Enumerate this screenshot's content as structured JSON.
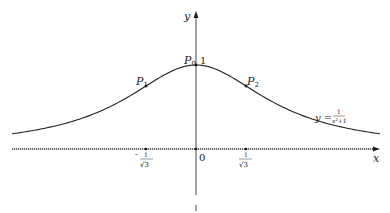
{
  "figure": {
    "axes": {
      "x_label": "x",
      "y_label": "y",
      "origin_label": "0"
    },
    "curve": {
      "equation_lhs": "y =",
      "equation_num": "1",
      "equation_den": "x²+1"
    },
    "points": [
      {
        "name": "P0",
        "label": "P",
        "sub": "0",
        "value_label": "1"
      },
      {
        "name": "P1",
        "label": "P",
        "sub": "1"
      },
      {
        "name": "P2",
        "label": "P",
        "sub": "2"
      }
    ],
    "x_ticks": [
      {
        "label_sign": "-",
        "num": "1",
        "den": "√3"
      },
      {
        "label_sign": "",
        "num": "1",
        "den": "√3"
      }
    ]
  },
  "chart_data": {
    "type": "line",
    "title": "",
    "function": "y = 1/(x^2+1)",
    "xlabel": "x",
    "ylabel": "y",
    "x": [
      -2.12,
      -1.5,
      -1.0,
      -0.577,
      0,
      0.577,
      1.0,
      1.5,
      2.12
    ],
    "values": [
      0.18,
      0.31,
      0.5,
      0.75,
      1.0,
      0.75,
      0.5,
      0.31,
      0.18
    ],
    "marked_points": [
      {
        "name": "P0",
        "x": 0,
        "y": 1
      },
      {
        "name": "P1",
        "x": -0.577,
        "y": 0.75
      },
      {
        "name": "P2",
        "x": 0.577,
        "y": 0.75
      }
    ],
    "x_tick_labels": [
      "-1/√3",
      "0",
      "1/√3"
    ],
    "y_tick_labels": [
      "1"
    ],
    "grid": false
  }
}
